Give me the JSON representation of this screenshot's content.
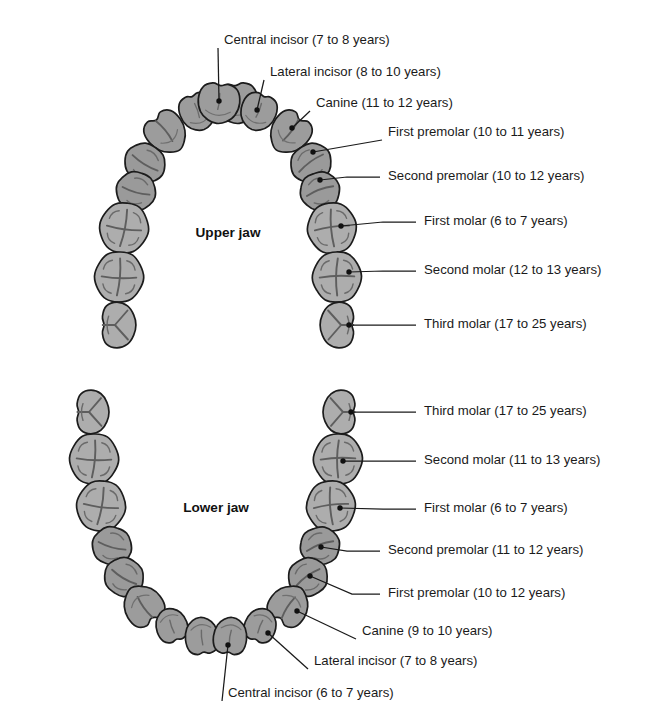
{
  "figure": {
    "background_color": "#ffffff",
    "line_color": "#1a1a1a"
  },
  "upper": {
    "jaw_title": "Upper jaw",
    "title_x": 228,
    "title_y": 233,
    "colors": {
      "molar_fill": "#adadad",
      "premolar_fill": "#9a9a9a",
      "anterior_fill": "#9c9c9c"
    },
    "labels": [
      {
        "name": "central-incisor",
        "text": "Central incisor (7 to 8 years)",
        "text_x": 224,
        "text_y": 41,
        "elbow_x": 224,
        "elbow_y": 41,
        "dot_x": 219,
        "dot_y": 101,
        "kind": "diagonal"
      },
      {
        "name": "lateral-incisor",
        "text": "Lateral incisor (8 to 10 years)",
        "text_x": 270,
        "text_y": 73,
        "elbow_x": 270,
        "elbow_y": 73,
        "dot_x": 257,
        "dot_y": 110,
        "kind": "diagonal"
      },
      {
        "name": "canine",
        "text": "Canine (11 to 12 years)",
        "text_x": 316,
        "text_y": 104,
        "elbow_x": 316,
        "elbow_y": 104,
        "dot_x": 292,
        "dot_y": 128,
        "kind": "diagonal"
      },
      {
        "name": "first-premolar",
        "text": "First premolar (10 to 11 years)",
        "text_x": 388,
        "text_y": 133,
        "elbow_x": 388,
        "elbow_y": 133,
        "dot_x": 313,
        "dot_y": 152,
        "kind": "diagonal"
      },
      {
        "name": "second-premolar",
        "text": "Second premolar (10 to 12 years)",
        "text_x": 388,
        "text_y": 177,
        "elbow_x": 347,
        "elbow_y": 177,
        "dot_x": 320,
        "dot_y": 180,
        "kind": "elbow"
      },
      {
        "name": "first-molar",
        "text": "First molar (6 to 7 years)",
        "text_x": 424,
        "text_y": 222,
        "elbow_x": 383,
        "elbow_y": 222,
        "dot_x": 341,
        "dot_y": 226,
        "kind": "elbow"
      },
      {
        "name": "second-molar",
        "text": "Second molar (12 to 13 years)",
        "text_x": 424,
        "text_y": 271,
        "elbow_x": 383,
        "elbow_y": 271,
        "dot_x": 349,
        "dot_y": 272,
        "kind": "elbow"
      },
      {
        "name": "third-molar",
        "text": "Third molar (17 to 25 years)",
        "text_x": 424,
        "text_y": 325,
        "elbow_x": 383,
        "elbow_y": 325,
        "dot_x": 349,
        "dot_y": 325,
        "kind": "elbow"
      }
    ]
  },
  "lower": {
    "jaw_title": "Lower jaw",
    "title_x": 216,
    "title_y": 508,
    "colors": {
      "molar_fill": "#adadad",
      "premolar_fill": "#9a9a9a",
      "anterior_fill": "#9c9c9c"
    },
    "labels": [
      {
        "name": "third-molar",
        "text": "Third molar (17 to 25 years)",
        "text_x": 424,
        "text_y": 412,
        "elbow_x": 383,
        "elbow_y": 412,
        "dot_x": 351,
        "dot_y": 412,
        "kind": "elbow"
      },
      {
        "name": "second-molar",
        "text": "Second molar (11 to 13 years)",
        "text_x": 424,
        "text_y": 461,
        "elbow_x": 383,
        "elbow_y": 461,
        "dot_x": 343,
        "dot_y": 461,
        "kind": "elbow"
      },
      {
        "name": "first-molar",
        "text": "First molar (6 to 7 years)",
        "text_x": 424,
        "text_y": 509,
        "elbow_x": 383,
        "elbow_y": 509,
        "dot_x": 340,
        "dot_y": 508,
        "kind": "elbow"
      },
      {
        "name": "second-premolar",
        "text": "Second premolar (11 to 12 years)",
        "text_x": 388,
        "text_y": 551,
        "elbow_x": 347,
        "elbow_y": 551,
        "dot_x": 321,
        "dot_y": 547,
        "kind": "elbow"
      },
      {
        "name": "first-premolar",
        "text": "First premolar (10 to 12 years)",
        "text_x": 388,
        "text_y": 594,
        "elbow_x": 352,
        "elbow_y": 594,
        "dot_x": 310,
        "dot_y": 576,
        "kind": "elbow"
      },
      {
        "name": "canine",
        "text": "Canine (9 to 10 years)",
        "text_x": 362,
        "text_y": 632,
        "elbow_x": 362,
        "elbow_y": 632,
        "dot_x": 297,
        "dot_y": 611,
        "kind": "diagonal"
      },
      {
        "name": "lateral-incisor",
        "text": "Lateral incisor (7 to 8 years)",
        "text_x": 314,
        "text_y": 662,
        "elbow_x": 314,
        "elbow_y": 662,
        "dot_x": 268,
        "dot_y": 633,
        "kind": "diagonal"
      },
      {
        "name": "central-incisor",
        "text": "Central incisor (6 to 7 years)",
        "text_x": 228,
        "text_y": 694,
        "elbow_x": 228,
        "elbow_y": 694,
        "dot_x": 228,
        "dot_y": 645,
        "kind": "diagonal"
      }
    ]
  },
  "teeth_counts": {
    "upper_total": 16,
    "lower_total": 16
  }
}
